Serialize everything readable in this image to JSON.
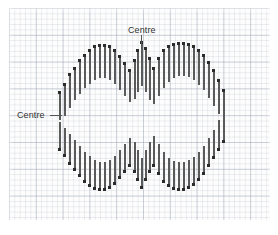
{
  "figure": {
    "shape_type": "lemniscate",
    "bar_color": "#5a5a5a",
    "endpoint_color": "#2b2b2b",
    "grid_minor_color": "#a5acb9",
    "grid_major_color": "#96a0af",
    "paper_color": "#fdfdfd"
  },
  "annotations": [
    {
      "id": "centre-top",
      "label": "Centre",
      "label_x": 128,
      "label_y": 25,
      "leader": {
        "x": 141,
        "y": 35,
        "length": 14,
        "orientation": "vertical"
      },
      "points_to": "upper cusp where the two loops meet"
    },
    {
      "id": "centre-left",
      "label": "Centre",
      "label_x": 17,
      "label_y": 110,
      "leader": {
        "x": 50,
        "y": 115,
        "length": 12,
        "orientation": "horizontal"
      },
      "points_to": "left-hand vertical axis of the left loop"
    }
  ],
  "chart_data": {
    "type": "bar",
    "subtitle": "",
    "xlabel": "",
    "ylabel": "",
    "grid": true,
    "legend": null,
    "xlim": [
      0,
      278
    ],
    "ylim": [
      0,
      235
    ],
    "note": "Each datum is a vertical segment from y_top to y_bottom at position x; dots mark the segment ends that trace the curve.",
    "series": [
      {
        "name": "upper-outline",
        "segments": [
          [
            59,
            92,
            120
          ],
          [
            64,
            84,
            116
          ],
          [
            69,
            74,
            108
          ],
          [
            74,
            68,
            100
          ],
          [
            79,
            60,
            94
          ],
          [
            84,
            55,
            88
          ],
          [
            89,
            50,
            84
          ],
          [
            94,
            46,
            80
          ],
          [
            99,
            45,
            78
          ],
          [
            104,
            45,
            78
          ],
          [
            109,
            46,
            80
          ],
          [
            114,
            50,
            84
          ],
          [
            119,
            56,
            90
          ],
          [
            124,
            63,
            96
          ],
          [
            129,
            70,
            102
          ],
          [
            134,
            60,
            99
          ],
          [
            137,
            50,
            92
          ],
          [
            141,
            42,
            86
          ],
          [
            145,
            48,
            92
          ],
          [
            149,
            58,
            100
          ],
          [
            153,
            68,
            104
          ],
          [
            158,
            58,
            96
          ],
          [
            163,
            50,
            88
          ],
          [
            168,
            46,
            82
          ],
          [
            173,
            44,
            78
          ],
          [
            178,
            43,
            76
          ],
          [
            183,
            43,
            76
          ],
          [
            188,
            44,
            77
          ],
          [
            193,
            46,
            80
          ],
          [
            198,
            50,
            85
          ],
          [
            203,
            55,
            90
          ],
          [
            208,
            62,
            98
          ],
          [
            213,
            70,
            106
          ],
          [
            218,
            80,
            114
          ],
          [
            223,
            90,
            124
          ]
        ]
      },
      {
        "name": "lower-outline",
        "segments": [
          [
            59,
            122,
            150
          ],
          [
            64,
            128,
            156
          ],
          [
            69,
            134,
            164
          ],
          [
            74,
            140,
            170
          ],
          [
            79,
            146,
            176
          ],
          [
            84,
            152,
            182
          ],
          [
            89,
            156,
            186
          ],
          [
            94,
            160,
            189
          ],
          [
            99,
            162,
            190
          ],
          [
            104,
            162,
            190
          ],
          [
            109,
            160,
            188
          ],
          [
            114,
            156,
            184
          ],
          [
            119,
            150,
            178
          ],
          [
            124,
            144,
            172
          ],
          [
            129,
            138,
            166
          ],
          [
            134,
            142,
            172
          ],
          [
            137,
            150,
            180
          ],
          [
            141,
            158,
            188
          ],
          [
            145,
            150,
            180
          ],
          [
            149,
            142,
            172
          ],
          [
            153,
            136,
            166
          ],
          [
            158,
            144,
            174
          ],
          [
            163,
            152,
            182
          ],
          [
            168,
            158,
            186
          ],
          [
            173,
            161,
            189
          ],
          [
            178,
            162,
            190
          ],
          [
            183,
            162,
            190
          ],
          [
            188,
            160,
            188
          ],
          [
            193,
            157,
            185
          ],
          [
            198,
            152,
            180
          ],
          [
            203,
            146,
            174
          ],
          [
            208,
            138,
            166
          ],
          [
            213,
            130,
            158
          ],
          [
            218,
            120,
            150
          ],
          [
            223,
            110,
            142
          ]
        ]
      }
    ]
  }
}
